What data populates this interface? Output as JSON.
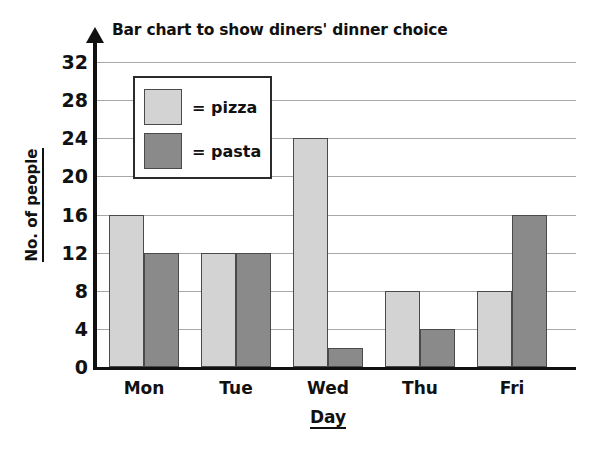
{
  "chart_data": {
    "type": "bar",
    "title": "Bar chart to show diners' dinner choice",
    "xlabel": "Day",
    "ylabel": "No. of people",
    "categories": [
      "Mon",
      "Tue",
      "Wed",
      "Thu",
      "Fri"
    ],
    "series": [
      {
        "name": "pizza",
        "legend_label": "= pizza",
        "color": "#d3d3d3",
        "values": [
          16,
          12,
          24,
          8,
          8
        ]
      },
      {
        "name": "pasta",
        "legend_label": "= pasta",
        "color": "#8a8a8a",
        "values": [
          12,
          12,
          2,
          4,
          16
        ]
      }
    ],
    "ylim": [
      0,
      32
    ],
    "y_ticks": [
      "0",
      "4",
      "8",
      "12",
      "16",
      "20",
      "24",
      "28",
      "32"
    ],
    "y_tick_values": [
      0,
      4,
      8,
      12,
      16,
      20,
      24,
      28,
      32
    ],
    "grid": true,
    "legend_position": "upper-left-inside"
  },
  "axis": {
    "y_title": "No. of people",
    "x_title": "Day"
  }
}
